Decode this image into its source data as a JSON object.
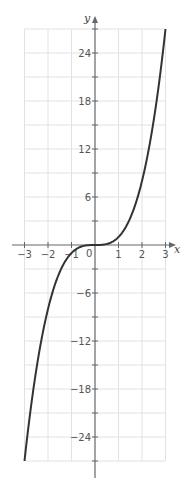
{
  "chart_data": {
    "type": "line",
    "title": "",
    "function": "y = x^3",
    "xlabel": "x",
    "ylabel": "y",
    "xlim": [
      -3,
      3
    ],
    "ylim": [
      -27,
      27
    ],
    "grid": true,
    "x_ticks": [
      -3,
      -2,
      -1,
      0,
      1,
      2,
      3
    ],
    "x_tick_labels": [
      "−3",
      "−2",
      "−1",
      "0",
      "1",
      "2",
      "3"
    ],
    "y_ticks": [
      -27,
      -24,
      -21,
      -18,
      -15,
      -12,
      -9,
      -6,
      -3,
      0,
      3,
      6,
      9,
      12,
      15,
      18,
      21,
      24,
      27
    ],
    "y_tick_labels": [
      {
        "value": 24,
        "label": "24"
      },
      {
        "value": 18,
        "label": "18"
      },
      {
        "value": 12,
        "label": "12"
      },
      {
        "value": 6,
        "label": "6"
      },
      {
        "value": -6,
        "label": "−6"
      },
      {
        "value": -12,
        "label": "−12"
      },
      {
        "value": -18,
        "label": "−18"
      },
      {
        "value": -24,
        "label": "−24"
      }
    ],
    "origin_label": "0",
    "series": [
      {
        "name": "y = x^3",
        "x": [
          -3,
          -2.5,
          -2,
          -1.5,
          -1,
          -0.5,
          0,
          0.5,
          1,
          1.5,
          2,
          2.5,
          3
        ],
        "values": [
          -27,
          -15.625,
          -8,
          -3.375,
          -1,
          -0.125,
          0,
          0.125,
          1,
          3.375,
          8,
          15.625,
          27
        ]
      }
    ],
    "legend": null
  },
  "colors": {
    "curve": "#333333",
    "axis": "#666666",
    "grid": "#e2e2e2",
    "label": "#555555"
  }
}
